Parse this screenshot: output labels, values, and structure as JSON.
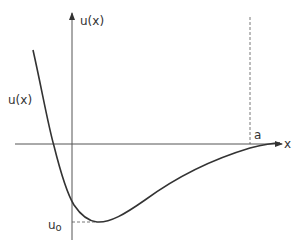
{
  "diagram": {
    "title": "",
    "y_axis_label": "u(x)",
    "x_axis_label": "x",
    "curve_label": "u(x)",
    "min_label": "u",
    "min_label_sub": "o",
    "boundary_label": "a",
    "colors": {
      "line": "#333333",
      "axis": "#555555",
      "background": "#ffffff"
    }
  }
}
